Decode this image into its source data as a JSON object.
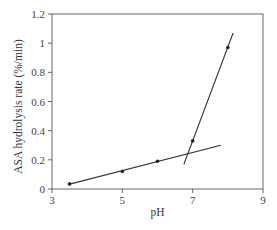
{
  "chart_data": {
    "type": "scatter",
    "title": "",
    "xlabel": "pH",
    "ylabel": "ASA hydrolysis rate (%/min)",
    "xlim": [
      3,
      9
    ],
    "ylim": [
      0,
      1.2
    ],
    "xticks": [
      3,
      5,
      7,
      9
    ],
    "xtick_labels": [
      "3",
      "5",
      "7",
      "9"
    ],
    "yticks": [
      0,
      0.2,
      0.4,
      0.6,
      0.8,
      1.0,
      1.2
    ],
    "ytick_labels": [
      "0",
      "0.2",
      "0.4",
      "0.6",
      "0.8",
      "1",
      "1.2"
    ],
    "grid": false,
    "legend": null,
    "series": [
      {
        "name": "measured",
        "kind": "points",
        "x": [
          3.5,
          5,
          6,
          7,
          8
        ],
        "y": [
          0.035,
          0.12,
          0.19,
          0.33,
          0.97
        ]
      },
      {
        "name": "low-pH fit",
        "kind": "line",
        "x": [
          3.45,
          7.8
        ],
        "y": [
          0.03,
          0.3
        ]
      },
      {
        "name": "high-pH fit",
        "kind": "line",
        "x": [
          6.75,
          8.15
        ],
        "y": [
          0.17,
          1.07
        ]
      }
    ]
  }
}
